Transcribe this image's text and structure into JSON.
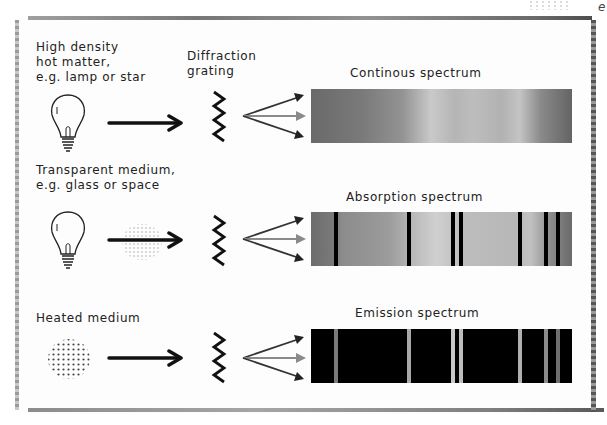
{
  "rows": [
    {
      "source_label": "High density\nhot matter,\ne.g. lamp or star",
      "source_icon": "lightbulb",
      "medium": null,
      "spectrum_title": "Continous spectrum",
      "spectrum_type": "continuous",
      "lines": []
    },
    {
      "source_label": "Transparent medium,\ne.g. glass or space",
      "source_icon": "lightbulb",
      "medium": "dotted-gas-cloud",
      "spectrum_title": "Absorption spectrum",
      "spectrum_type": "absorption",
      "lines": [
        {
          "pos_pct": 9.6,
          "width_px": 4,
          "color": "#000000"
        },
        {
          "pos_pct": 37.5,
          "width_px": 4,
          "color": "#000000"
        },
        {
          "pos_pct": 54.4,
          "width_px": 4,
          "color": "#000000"
        },
        {
          "pos_pct": 57.5,
          "width_px": 4,
          "color": "#000000"
        },
        {
          "pos_pct": 80.1,
          "width_px": 4,
          "color": "#000000"
        },
        {
          "pos_pct": 90.0,
          "width_px": 4,
          "color": "#000000"
        },
        {
          "pos_pct": 94.6,
          "width_px": 4,
          "color": "#000000"
        }
      ]
    },
    {
      "source_label": "Heated medium",
      "source_icon": "dotted-gas-cloud",
      "medium": null,
      "spectrum_title": "Emission spectrum",
      "spectrum_type": "emission",
      "lines": [
        {
          "pos_pct": 9.6,
          "width_px": 4,
          "color": "#7a7a7a"
        },
        {
          "pos_pct": 37.5,
          "width_px": 4,
          "color": "#a8a8a8"
        },
        {
          "pos_pct": 54.4,
          "width_px": 4,
          "color": "#c8c8c8"
        },
        {
          "pos_pct": 57.5,
          "width_px": 4,
          "color": "#bdbdbd"
        },
        {
          "pos_pct": 80.1,
          "width_px": 4,
          "color": "#b0b0b0"
        },
        {
          "pos_pct": 90.0,
          "width_px": 4,
          "color": "#8a8a8a"
        },
        {
          "pos_pct": 94.6,
          "width_px": 4,
          "color": "#6e6e6e"
        }
      ]
    }
  ],
  "grating_label": "Diffraction\ngrating",
  "colors": {
    "ink": "#111111",
    "fan_middle": "#8a8a8a",
    "fan_outer": "#333333",
    "emission_bg": "#000000"
  }
}
